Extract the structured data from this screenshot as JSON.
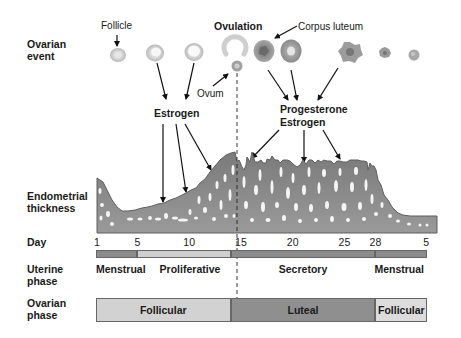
{
  "row_labels": {
    "ovarian_event": [
      "Ovarian",
      "event"
    ],
    "endometrial_thickness": [
      "Endometrial",
      "thickness"
    ],
    "day": "Day",
    "uterine_phase": [
      "Uterine",
      "phase"
    ],
    "ovarian_phase": [
      "Ovarian",
      "phase"
    ]
  },
  "annotations": {
    "follicle": "Follicle",
    "ovulation": "Ovulation",
    "corpus_luteum": "Corpus luteum",
    "ovum": "Ovum",
    "estrogen": "Estrogen",
    "progesterone": "Progesterone",
    "estrogen_luteal": "Estrogen"
  },
  "day_ticks": [
    "1",
    "5",
    "10",
    "15",
    "20",
    "25",
    "28",
    "5"
  ],
  "uterine_phases": [
    {
      "label": "Menstrual",
      "start_day": 1,
      "end_day": 5,
      "color": "#8c8c8c"
    },
    {
      "label": "Proliferative",
      "start_day": 5,
      "end_day": 14,
      "color": "#cfcfcf"
    },
    {
      "label": "Secretory",
      "start_day": 14,
      "end_day": 28,
      "color": "#8c8c8c"
    },
    {
      "label": "Menstrual",
      "start_day": 28,
      "end_day": 33,
      "color": "#8c8c8c"
    }
  ],
  "ovarian_phases": [
    {
      "label": "Follicular",
      "start_day": 1,
      "end_day": 14,
      "color": "#d2d2d2"
    },
    {
      "label": "Luteal",
      "start_day": 14,
      "end_day": 28,
      "color": "#8f8f8f"
    },
    {
      "label": "Follicular",
      "start_day": 28,
      "end_day": 33,
      "color": "#dcdcdc"
    }
  ],
  "ovulation_day": 14,
  "colors": {
    "tissue": "#8a8a8a",
    "tissue_dark": "#6a6a6a",
    "follicle": "#cfcfcf",
    "corpus_luteum": "#9a9a9a"
  }
}
